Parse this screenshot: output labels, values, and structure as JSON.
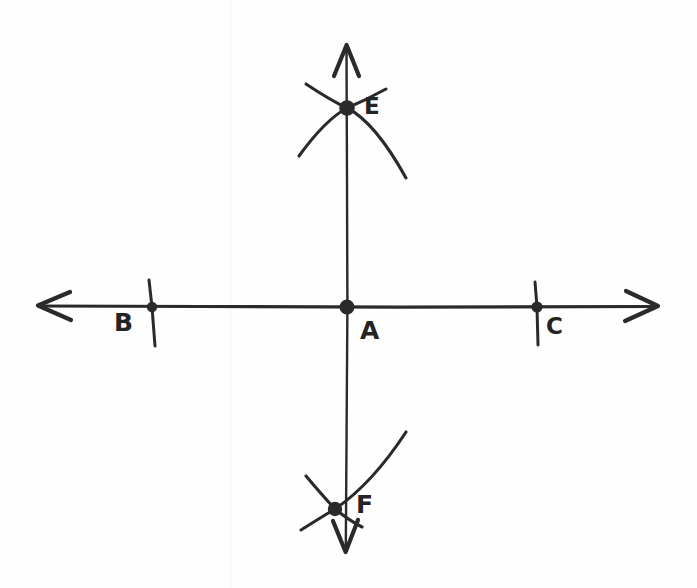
{
  "figure": {
    "ink_color": "#2a2a2a",
    "background_color": "#fefefe",
    "width": 697,
    "height": 588
  },
  "points": {
    "a": {
      "label": "A",
      "role": "origin-intersection",
      "x": 347,
      "y": 307,
      "label_x": 360,
      "label_y": 318
    },
    "b": {
      "label": "B",
      "role": "left-tick-point",
      "x": 152,
      "y": 307,
      "label_x": 114,
      "label_y": 310
    },
    "c": {
      "label": "C",
      "role": "right-tick-point",
      "x": 537,
      "y": 307,
      "label_x": 546,
      "label_y": 315
    },
    "e": {
      "label": "E",
      "role": "upper-arc-intersection",
      "x": 347,
      "y": 108,
      "label_x": 364,
      "label_y": 95
    },
    "f": {
      "label": "F",
      "role": "lower-arc-intersection",
      "x": 335,
      "y": 509,
      "label_x": 356,
      "label_y": 492
    }
  },
  "axes": {
    "horizontal": {
      "name": "horizontal-line",
      "from_x": 38,
      "to_x": 658,
      "y": 307,
      "arrows": "both"
    },
    "vertical": {
      "name": "vertical-line",
      "x": 347,
      "from_y": 45,
      "to_y": 552,
      "arrows": "both"
    }
  },
  "tick_marks": [
    {
      "name": "tick-b",
      "at_point": "B"
    },
    {
      "name": "tick-c",
      "at_point": "C"
    }
  ],
  "arcs": [
    {
      "name": "arc-upper-left",
      "through": "E"
    },
    {
      "name": "arc-upper-right",
      "through": "E"
    },
    {
      "name": "arc-lower-left",
      "through": "F"
    },
    {
      "name": "arc-lower-right",
      "through": "F"
    }
  ]
}
